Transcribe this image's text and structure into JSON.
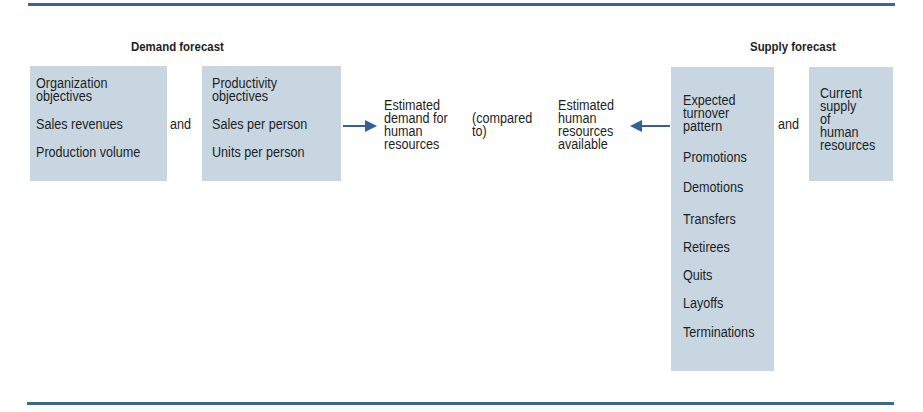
{
  "demand": {
    "title": "Demand forecast",
    "box1": {
      "header": [
        "Organization",
        "objectives"
      ],
      "items": [
        "Sales revenues",
        "Production volume"
      ]
    },
    "connector": "and",
    "box2": {
      "header": [
        "Productivity",
        "objectives"
      ],
      "items": [
        "Sales per person",
        "Units per person"
      ]
    },
    "result": [
      "Estimated",
      "demand for",
      "human",
      "resources"
    ]
  },
  "comparison": [
    "(compared",
    "to)"
  ],
  "supply": {
    "title": "Supply forecast",
    "result": [
      "Estimated",
      "human",
      "resources",
      "available"
    ],
    "box3": {
      "header": [
        "Expected",
        "turnover",
        "pattern"
      ],
      "items": [
        "Promotions",
        "Demotions",
        "Transfers",
        "Retirees",
        "Quits",
        "Layoffs",
        "Terminations"
      ]
    },
    "connector": "and",
    "box4": {
      "lines": [
        "Current",
        "supply",
        "of",
        "human",
        "resources"
      ]
    }
  },
  "colors": {
    "rule": "#3a6690",
    "box_fill": "#c8d6e2",
    "arrow": "#2f6398",
    "text": "#1e1e1e"
  }
}
